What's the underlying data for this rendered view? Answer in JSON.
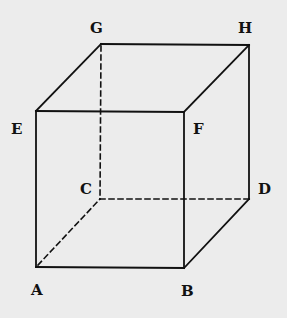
{
  "diagram": {
    "type": "cube-wireframe",
    "vertices": {
      "A": {
        "x": 36,
        "y": 267
      },
      "B": {
        "x": 184,
        "y": 268
      },
      "C": {
        "x": 100,
        "y": 199
      },
      "D": {
        "x": 249,
        "y": 199
      },
      "E": {
        "x": 36,
        "y": 111
      },
      "F": {
        "x": 184,
        "y": 112
      },
      "G": {
        "x": 101,
        "y": 44
      },
      "H": {
        "x": 249,
        "y": 45
      }
    },
    "labels": [
      {
        "text": "A",
        "x": 31,
        "y": 295
      },
      {
        "text": "B",
        "x": 181,
        "y": 296
      },
      {
        "text": "C",
        "x": 80,
        "y": 194
      },
      {
        "text": "D",
        "x": 258,
        "y": 194
      },
      {
        "text": "E",
        "x": 11,
        "y": 134
      },
      {
        "text": "F",
        "x": 193,
        "y": 134
      },
      {
        "text": "G",
        "x": 90,
        "y": 33
      },
      {
        "text": "H",
        "x": 238,
        "y": 33
      }
    ],
    "solid_edges": [
      "AB",
      "AE",
      "EF",
      "BF",
      "EG",
      "GH",
      "FH",
      "HD",
      "BD"
    ],
    "dashed_edges": [
      "GC",
      "CD",
      "AC"
    ]
  }
}
